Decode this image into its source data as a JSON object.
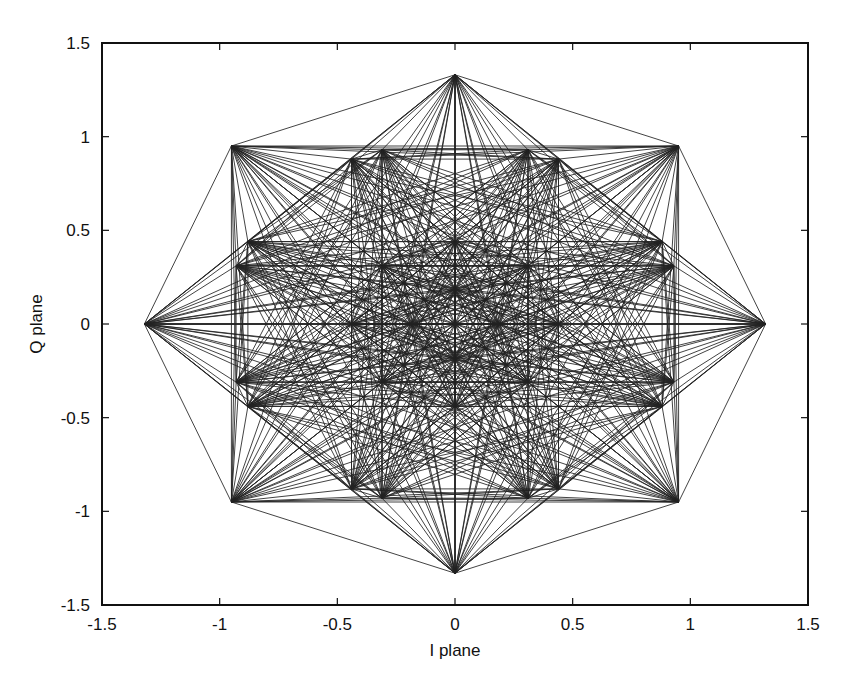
{
  "chart_data": {
    "type": "scatter",
    "title": "",
    "xlabel": "I plane",
    "ylabel": "Q plane",
    "xlim": [
      -1.5,
      1.5
    ],
    "ylim": [
      -1.5,
      1.5
    ],
    "xticks": [
      "-1.5",
      "-1",
      "-0.5",
      "0",
      "0.5",
      "1",
      "1.5"
    ],
    "yticks": [
      "-1.5",
      "-1",
      "-0.5",
      "0",
      "0.5",
      "1",
      "1.5"
    ],
    "grid": false,
    "legend": null,
    "connect_all_pairs": true,
    "line_color": "#222222",
    "points": {
      "outer_ring": [
        [
          1.32,
          0
        ],
        [
          0.95,
          0.95
        ],
        [
          0,
          1.33
        ],
        [
          -0.95,
          0.95
        ],
        [
          -1.32,
          0
        ],
        [
          -0.95,
          -0.95
        ],
        [
          0,
          -1.33
        ],
        [
          0.95,
          -0.95
        ]
      ],
      "middle_ring": [
        [
          0.93,
          0.31
        ],
        [
          0.88,
          0.44
        ],
        [
          0.44,
          0.88
        ],
        [
          0.31,
          0.93
        ],
        [
          -0.31,
          0.93
        ],
        [
          -0.44,
          0.88
        ],
        [
          -0.88,
          0.44
        ],
        [
          -0.93,
          0.31
        ],
        [
          -0.93,
          -0.31
        ],
        [
          -0.88,
          -0.44
        ],
        [
          -0.44,
          -0.88
        ],
        [
          -0.31,
          -0.93
        ],
        [
          0.31,
          -0.93
        ],
        [
          0.44,
          -0.88
        ],
        [
          0.88,
          -0.44
        ],
        [
          0.93,
          -0.31
        ]
      ],
      "inner_ring": [
        [
          0.44,
          0
        ],
        [
          0.31,
          0.31
        ],
        [
          0,
          0.44
        ],
        [
          -0.31,
          0.31
        ],
        [
          -0.44,
          0
        ],
        [
          -0.31,
          -0.31
        ],
        [
          0,
          -0.44
        ],
        [
          0.31,
          -0.31
        ]
      ],
      "core": [
        [
          0.19,
          0
        ],
        [
          0,
          0.19
        ],
        [
          -0.19,
          0
        ],
        [
          0,
          -0.19
        ]
      ]
    }
  }
}
